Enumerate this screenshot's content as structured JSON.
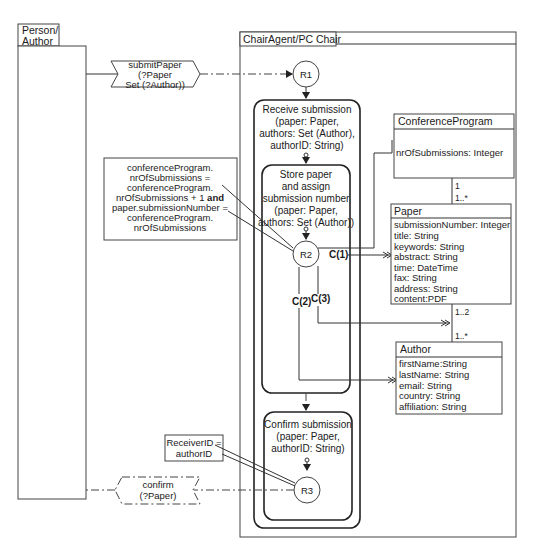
{
  "lanes": {
    "person": {
      "title_line1": "Person/",
      "title_line2": "Author"
    },
    "chair": {
      "title": "ChairAgent/PC Chair"
    }
  },
  "messages": {
    "submit": {
      "line1": "submitPaper",
      "line2": "(?Paper",
      "line3": "Set (?Author))"
    },
    "confirm": {
      "line1": "confirm",
      "line2": "(?Paper)"
    }
  },
  "nodes": {
    "r1": "R1",
    "r2": "R2",
    "r3": "R3"
  },
  "activities": {
    "receive": {
      "line1": "Receive submission",
      "line2": "(paper: Paper,",
      "line3": "authors: Set (Author),",
      "line4": "authorID: String)"
    },
    "store": {
      "line1": "Store paper",
      "line2": "and assign",
      "line3": "submission number",
      "line4": "(paper: Paper,",
      "line5": "authors: Set (Author))"
    },
    "confirm": {
      "line1": "Confirm submission",
      "line2": "(paper: Paper,",
      "line3": "authorID: String)"
    }
  },
  "notes": {
    "constraint": {
      "line1": "conferenceProgram.",
      "line2": "nrOfSubmissions =",
      "line3": "conferenceProgram.",
      "line4a": "nrOfSubmissions + 1 ",
      "line4b": "and",
      "line5": "paper.submissionNumber =",
      "line6": "conferenceProgram.",
      "line7": "nrOfSubmissions"
    },
    "receiver": {
      "line1": "ReceiverID =",
      "line2": "authorID"
    }
  },
  "links": {
    "c1": "C(1)",
    "c2": "C(2)",
    "c3": "C(3)"
  },
  "classes": {
    "conferenceProgram": {
      "name": "ConferenceProgram",
      "attributes": [
        "nrOfSubmissions: Integer"
      ]
    },
    "paper": {
      "name": "Paper",
      "attributes": [
        "submissionNumber: Integer",
        "title: String",
        "keywords: String",
        "abstract: String",
        "time: DateTime",
        "fax: String",
        "address: String",
        "content:PDF"
      ]
    },
    "author": {
      "name": "Author",
      "attributes": [
        "firstName:String",
        "lastName: String",
        "email: String",
        "country: String",
        "affiliation: String"
      ]
    }
  },
  "multiplicities": {
    "cp_top": "1",
    "cp_paper": "1..*",
    "paper_author": "1..2",
    "author_paper": "1..*"
  }
}
